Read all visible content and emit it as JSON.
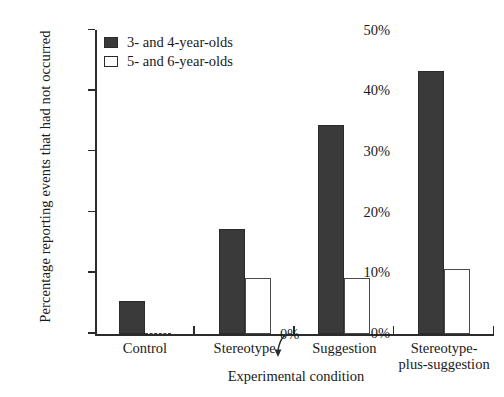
{
  "chart_data": {
    "type": "bar",
    "title": "",
    "xlabel": "Experimental condition",
    "ylabel": "Percentage reporting events that had not occurred",
    "categories": [
      "Control",
      "Stereotype",
      "Suggestion",
      "Stereotype-\nplus-suggestion"
    ],
    "ylim": [
      0,
      50
    ],
    "yticks": [
      0,
      10,
      20,
      30,
      40,
      50
    ],
    "ytick_labels": [
      "0%",
      "10%",
      "20%",
      "30%",
      "40%",
      "50%"
    ],
    "grid": false,
    "legend_position": "upper-left-inside",
    "series": [
      {
        "name": "3- and 4-year-olds",
        "color": "#3a3a3a",
        "values": [
          5.3,
          17.2,
          34.4,
          43.2
        ]
      },
      {
        "name": "5- and 6-year-olds",
        "color": "#ffffff",
        "values": [
          0,
          9.1,
          9.1,
          10.6
        ]
      }
    ],
    "annotations": [
      {
        "text": "0%",
        "target_series": "5- and 6-year-olds",
        "target_category": "Control",
        "value": 0
      }
    ]
  },
  "axis": {
    "y_title": "Percentage reporting events that had not occurred",
    "x_title": "Experimental condition"
  },
  "legend": {
    "items": [
      {
        "label": "3- and 4-year-olds",
        "swatch": "filled-dark-square"
      },
      {
        "label": "5- and 6-year-olds",
        "swatch": "open-white-square"
      }
    ]
  },
  "annotation": {
    "zero_label": "0%"
  },
  "colors": {
    "dark_bar": "#3a3a3a",
    "light_bar": "#ffffff",
    "axis": "#2b2b2b",
    "background": "#ffffff"
  }
}
